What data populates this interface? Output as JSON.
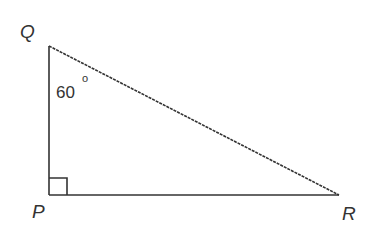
{
  "diagram": {
    "type": "right-triangle",
    "vertices": {
      "Q": {
        "label": "Q"
      },
      "P": {
        "label": "P"
      },
      "R": {
        "label": "R"
      }
    },
    "angle_Q": {
      "value": "60",
      "unit": "o"
    },
    "right_angle_at": "P",
    "line_color": "#333333"
  }
}
